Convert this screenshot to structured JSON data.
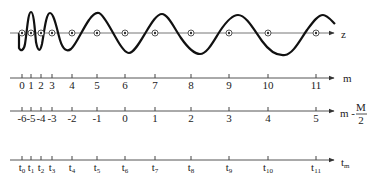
{
  "diagram": {
    "colors": {
      "ink": "#1a1a1a",
      "axis": "#555555",
      "background": "#ffffff"
    },
    "positions_px": [
      22,
      31,
      41,
      52,
      72,
      97,
      125,
      155,
      191,
      229,
      268,
      316
    ],
    "wave_axis": {
      "label": "z",
      "y": 33
    },
    "axes": [
      {
        "id": "m",
        "label": "m",
        "y": 78,
        "ticks": [
          "0",
          "1",
          "2",
          "3",
          "4",
          "5",
          "6",
          "7",
          "8",
          "9",
          "10",
          "11"
        ]
      },
      {
        "id": "m-half",
        "label_main": "m - ",
        "label_num": "M",
        "label_den": "2",
        "y": 111,
        "ticks": [
          "-6",
          "-5",
          "-4",
          "-3",
          "-2",
          "-1",
          "0",
          "1",
          "2",
          "3",
          "4",
          "5"
        ]
      },
      {
        "id": "t",
        "label_main": "t",
        "label_sub": "m",
        "y": 160,
        "ticks": [
          {
            "base": "t",
            "sub": "0"
          },
          {
            "base": "t",
            "sub": "1"
          },
          {
            "base": "t",
            "sub": "2"
          },
          {
            "base": "t",
            "sub": "3"
          },
          {
            "base": "t",
            "sub": "4"
          },
          {
            "base": "t",
            "sub": "5"
          },
          {
            "base": "t",
            "sub": "6"
          },
          {
            "base": "t",
            "sub": "7"
          },
          {
            "base": "t",
            "sub": "8"
          },
          {
            "base": "t",
            "sub": "9"
          },
          {
            "base": "t",
            "sub": "10"
          },
          {
            "base": "t",
            "sub": "11"
          }
        ]
      }
    ]
  }
}
